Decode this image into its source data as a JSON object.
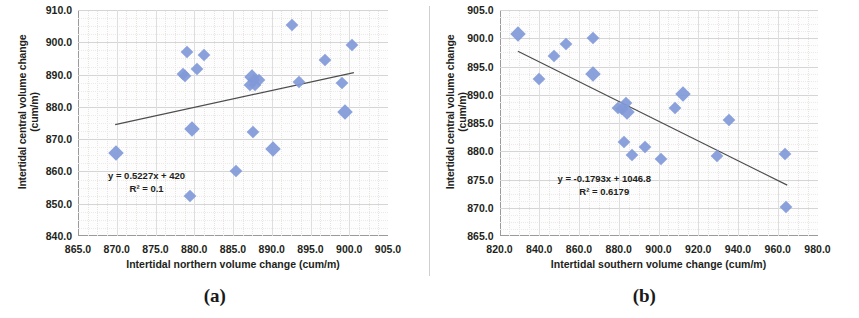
{
  "figure": {
    "panels": [
      {
        "caption": "(a)",
        "xlabel": "Intertidal northern volume change (cum/m)",
        "ylabel_line1": "Intertidal central volume change",
        "ylabel_line2": "(cum/m)",
        "equation": "y = 0.5227x + 420",
        "r2": "R² = 0.1"
      },
      {
        "caption": "(b)",
        "xlabel": "Intertidal southern volume change (cum/m)",
        "ylabel_line1": "Intertidal central volume change",
        "ylabel_line2": "(cum/m)",
        "equation": "y = -0.1793x + 1046.8",
        "r2": "R² = 0.6179"
      }
    ],
    "colors": {
      "marker": "#8199d8",
      "trendline": "#4d4d4d",
      "gridline": "#d5d5d5",
      "axis": "#9a9a9a",
      "text": "#231f20"
    }
  },
  "chart_data": [
    {
      "type": "scatter",
      "panel": "(a)",
      "title": "",
      "xlabel": "Intertidal northern volume change (cum/m)",
      "ylabel": "Intertidal central volume change (cum/m)",
      "xlim": [
        865.0,
        905.0
      ],
      "ylim": [
        840.0,
        910.0
      ],
      "xticks": [
        "865.0",
        "870.0",
        "875.0",
        "880.0",
        "885.0",
        "890.0",
        "895.0",
        "900.0",
        "905.0"
      ],
      "yticks": [
        "840.0",
        "850.0",
        "860.0",
        "870.0",
        "880.0",
        "890.0",
        "900.0",
        "910.0"
      ],
      "grid": true,
      "legend": "none",
      "series": [
        {
          "name": "Intertidal central vs northern volume change",
          "marker": "diamond",
          "color": "#8199d8",
          "points": [
            {
              "x": 869.9,
              "y": 865.8
            },
            {
              "x": 878.6,
              "y": 890.2
            },
            {
              "x": 878.8,
              "y": 889.5
            },
            {
              "x": 879.0,
              "y": 897.0
            },
            {
              "x": 879.5,
              "y": 852.5
            },
            {
              "x": 879.7,
              "y": 873.2
            },
            {
              "x": 880.3,
              "y": 891.6
            },
            {
              "x": 881.2,
              "y": 896.0
            },
            {
              "x": 885.4,
              "y": 860.0
            },
            {
              "x": 887.2,
              "y": 886.7
            },
            {
              "x": 887.5,
              "y": 889.2
            },
            {
              "x": 887.7,
              "y": 888.2
            },
            {
              "x": 887.9,
              "y": 886.9
            },
            {
              "x": 887.6,
              "y": 872.2
            },
            {
              "x": 888.3,
              "y": 888.3
            },
            {
              "x": 890.1,
              "y": 866.8
            },
            {
              "x": 892.6,
              "y": 905.5
            },
            {
              "x": 893.5,
              "y": 887.8
            },
            {
              "x": 896.9,
              "y": 894.6
            },
            {
              "x": 899.1,
              "y": 887.5
            },
            {
              "x": 899.4,
              "y": 878.3
            },
            {
              "x": 900.4,
              "y": 899.3
            }
          ]
        }
      ],
      "trendline": {
        "equation": "y = 0.5227x + 420",
        "slope": 0.5227,
        "intercept": 420,
        "r2_label": "R² = 0.1",
        "r2": 0.1,
        "x_start": 869.8,
        "y_start": 874.5,
        "x_end": 900.6,
        "y_end": 890.6
      }
    },
    {
      "type": "scatter",
      "panel": "(b)",
      "title": "",
      "xlabel": "Intertidal southern volume change (cum/m)",
      "ylabel": "Intertidal central volume change (cum/m)",
      "xlim": [
        820.0,
        980.0
      ],
      "ylim": [
        865.0,
        905.0
      ],
      "xticks": [
        "820.0",
        "840.0",
        "860.0",
        "880.0",
        "900.0",
        "920.0",
        "940.0",
        "960.0",
        "980.0"
      ],
      "yticks": [
        "865.0",
        "870.0",
        "875.0",
        "880.0",
        "885.0",
        "890.0",
        "895.0",
        "900.0",
        "905.0"
      ],
      "grid": true,
      "legend": "none",
      "series": [
        {
          "name": "Intertidal central vs southern volume change",
          "marker": "diamond",
          "color": "#8199d8",
          "points": [
            {
              "x": 829.5,
              "y": 900.8
            },
            {
              "x": 839.8,
              "y": 892.7
            },
            {
              "x": 847.2,
              "y": 896.9
            },
            {
              "x": 853.4,
              "y": 899.0
            },
            {
              "x": 866.8,
              "y": 900.1
            },
            {
              "x": 867.1,
              "y": 893.6
            },
            {
              "x": 879.8,
              "y": 887.7
            },
            {
              "x": 881.4,
              "y": 887.4
            },
            {
              "x": 882.6,
              "y": 881.6
            },
            {
              "x": 883.4,
              "y": 888.5
            },
            {
              "x": 884.3,
              "y": 887.0
            },
            {
              "x": 886.8,
              "y": 879.3
            },
            {
              "x": 893.2,
              "y": 880.8
            },
            {
              "x": 901.5,
              "y": 878.7
            },
            {
              "x": 908.1,
              "y": 887.7
            },
            {
              "x": 912.2,
              "y": 890.1
            },
            {
              "x": 929.6,
              "y": 879.2
            },
            {
              "x": 935.6,
              "y": 885.6
            },
            {
              "x": 963.8,
              "y": 879.6
            },
            {
              "x": 964.2,
              "y": 870.1
            }
          ]
        }
      ],
      "trendline": {
        "equation": "y = -0.1793x + 1046.8",
        "slope": -0.1793,
        "intercept": 1046.8,
        "r2_label": "R² = 0.6179",
        "r2": 0.6179,
        "x_start": 829.0,
        "y_start": 897.7,
        "x_end": 964.5,
        "y_end": 874.0
      }
    }
  ]
}
